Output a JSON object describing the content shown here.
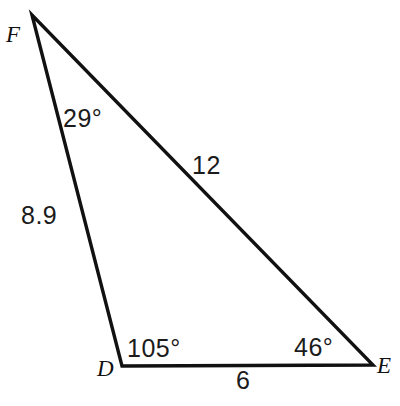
{
  "figure": {
    "background_color": "#ffffff",
    "stroke_color": "#111111",
    "text_color": "#1b1b1b",
    "width": 400,
    "height": 406
  },
  "vertices": [
    {
      "name": "F",
      "label": "F",
      "x": 32,
      "y": 15
    },
    {
      "name": "D",
      "label": "D",
      "x": 122,
      "y": 366
    },
    {
      "name": "E",
      "label": "E",
      "x": 373,
      "y": 365
    }
  ],
  "angles": [
    {
      "at": "F",
      "label": "29°",
      "value": 29
    },
    {
      "at": "D",
      "label": "105°",
      "value": 105
    },
    {
      "at": "E",
      "label": "46°",
      "value": 46
    }
  ],
  "sides": [
    {
      "name": "DF",
      "label": "8.9",
      "value": 8.9
    },
    {
      "name": "FE",
      "label": "12",
      "value": 12
    },
    {
      "name": "DE",
      "label": "6",
      "value": 6
    }
  ]
}
